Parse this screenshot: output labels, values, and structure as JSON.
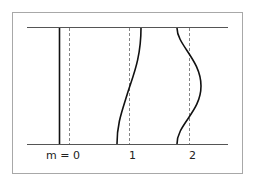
{
  "diagram": {
    "labels": {
      "m0": "m = 0",
      "m1": "1",
      "m2": "2"
    },
    "modes": [
      {
        "m": 0,
        "shape": "straight"
      },
      {
        "m": 1,
        "shape": "half-sine tilt"
      },
      {
        "m": 2,
        "shape": "full sine"
      }
    ],
    "colors": {
      "frame": "#a0a0a0",
      "boundary": "#555555",
      "curve": "#111111",
      "dashed": "#666666",
      "text": "#222222"
    }
  }
}
